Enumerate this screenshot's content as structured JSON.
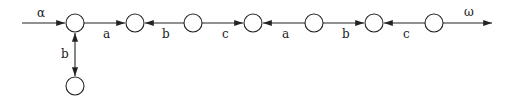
{
  "diagram": {
    "nodes": [
      {
        "id": "n1",
        "x": 75,
        "y": 23
      },
      {
        "id": "n2",
        "x": 135,
        "y": 23
      },
      {
        "id": "n3",
        "x": 193,
        "y": 23
      },
      {
        "id": "n4",
        "x": 253,
        "y": 23
      },
      {
        "id": "n5",
        "x": 314,
        "y": 23
      },
      {
        "id": "n6",
        "x": 374,
        "y": 23
      },
      {
        "id": "n7",
        "x": 434,
        "y": 23
      },
      {
        "id": "n8",
        "x": 75,
        "y": 86
      }
    ],
    "edges": [
      {
        "from": "n1",
        "to": "n2",
        "label": "a"
      },
      {
        "from": "n3",
        "to": "n2",
        "label": "b"
      },
      {
        "from": "n3",
        "to": "n4",
        "label": "c"
      },
      {
        "from": "n5",
        "to": "n4",
        "label": "a"
      },
      {
        "from": "n5",
        "to": "n6",
        "label": "b"
      },
      {
        "from": "n7",
        "to": "n6",
        "label": "c"
      },
      {
        "from": "n1",
        "to": "n8",
        "label": "b",
        "bidirectional": true
      }
    ],
    "input_label": "α",
    "output_label": "ω",
    "labels": {
      "e1": "a",
      "e2": "b",
      "e3": "c",
      "e4": "a",
      "e5": "b",
      "e6": "c",
      "e7": "b"
    }
  }
}
